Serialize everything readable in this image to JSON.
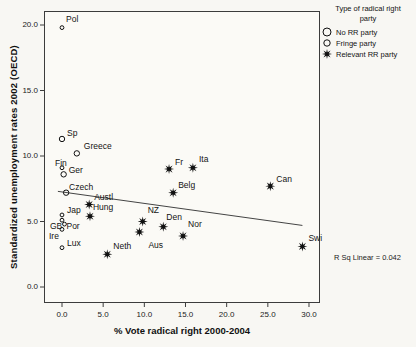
{
  "figure": {
    "colors": {
      "background": "#f8f7f3",
      "frame": "#3c3c3c",
      "marker": "#101010",
      "fit_line": "#444444",
      "text": "#131313"
    }
  },
  "legend": {
    "title_line1": "Type of radical right",
    "title_line2": "party",
    "items": [
      {
        "label": "No RR party",
        "marker": "circle-large"
      },
      {
        "label": "Fringe party",
        "marker": "circle-small"
      },
      {
        "label": "Relevant RR party",
        "marker": "star"
      }
    ]
  },
  "annotation": {
    "r_sq": "R Sq Linear = 0.042"
  },
  "chart_data": {
    "type": "scatter",
    "title": "",
    "xlabel": "% Vote radical right 2000-2004",
    "ylabel": "Standardized unemployment rates 2002 (OECD)",
    "xlim": [
      -2.2,
      31.3
    ],
    "ylim": [
      -1.2,
      21.1
    ],
    "grid": false,
    "legend_position": "top-right-outside",
    "xticks": {
      "values": [
        0,
        5,
        10,
        15,
        20,
        25,
        30
      ],
      "labels": [
        "0.0",
        "5.0",
        "10.0",
        "15.0",
        "20.0",
        "25.0",
        "30.0"
      ]
    },
    "yticks": {
      "values": [
        0,
        5,
        10,
        15,
        20
      ],
      "labels": [
        "0.0",
        "5.0",
        "10.0",
        "15.0",
        "20.0"
      ]
    },
    "series": [
      {
        "name": "No RR party",
        "marker": "circle-large",
        "points": [
          {
            "label": "Sp",
            "x": 0.0,
            "y": 11.3,
            "label_dx": 5,
            "label_dy": -11
          },
          {
            "label": "Greece",
            "x": 1.8,
            "y": 10.2,
            "label_dx": 7,
            "label_dy": -12
          },
          {
            "label": "Ger",
            "x": 0.2,
            "y": 8.6,
            "label_dx": 5,
            "label_dy": -9
          },
          {
            "label": "Czech",
            "x": 0.5,
            "y": 7.2,
            "label_dx": 3,
            "label_dy": -11
          }
        ]
      },
      {
        "name": "Fringe party",
        "marker": "circle-small",
        "points": [
          {
            "label": "Pol",
            "x": 0.0,
            "y": 19.8,
            "label_dx": 4,
            "label_dy": -14
          },
          {
            "label": "Fin",
            "x": 0.0,
            "y": 9.1,
            "label_dx": -7,
            "label_dy": -10
          },
          {
            "label": "Jap",
            "x": 0.0,
            "y": 5.5,
            "label_dx": 5,
            "label_dy": -10
          },
          {
            "label": "GB",
            "x": 0.0,
            "y": 5.1,
            "label_dx": -12,
            "label_dy": 1
          },
          {
            "label": "Por",
            "x": 0.3,
            "y": 4.8,
            "label_dx": 2,
            "label_dy": -3
          },
          {
            "label": "Ire",
            "x": 0.0,
            "y": 4.4,
            "label_dx": -13,
            "label_dy": 2
          },
          {
            "label": "Lux",
            "x": 0.0,
            "y": 3.0,
            "label_dx": 5,
            "label_dy": -10
          }
        ]
      },
      {
        "name": "Relevant RR party",
        "marker": "star",
        "points": [
          {
            "label": "Austl",
            "x": 3.3,
            "y": 6.3,
            "label_dx": 5,
            "label_dy": -12
          },
          {
            "label": "Hung",
            "x": 3.4,
            "y": 5.4,
            "label_dx": 3,
            "label_dy": -14
          },
          {
            "label": "Neth",
            "x": 5.5,
            "y": 2.5,
            "label_dx": 6,
            "label_dy": -13
          },
          {
            "label": "NZ",
            "x": 9.8,
            "y": 5.0,
            "label_dx": 5,
            "label_dy": -17
          },
          {
            "label": "Aus",
            "x": 9.4,
            "y": 4.2,
            "label_dx": 9,
            "label_dy": 8
          },
          {
            "label": "Den",
            "x": 12.3,
            "y": 4.6,
            "label_dx": 3,
            "label_dy": -15
          },
          {
            "label": "Nor",
            "x": 14.7,
            "y": 3.9,
            "label_dx": 5,
            "label_dy": -17
          },
          {
            "label": "Fr",
            "x": 13.0,
            "y": 9.0,
            "label_dx": 6,
            "label_dy": -12
          },
          {
            "label": "Ita",
            "x": 15.9,
            "y": 9.1,
            "label_dx": 6,
            "label_dy": -14
          },
          {
            "label": "Belg",
            "x": 13.5,
            "y": 7.2,
            "label_dx": 5,
            "label_dy": -13
          },
          {
            "label": "Can",
            "x": 25.3,
            "y": 7.7,
            "label_dx": 6,
            "label_dy": -12
          },
          {
            "label": "Swi",
            "x": 29.2,
            "y": 3.1,
            "label_dx": 6,
            "label_dy": -13
          }
        ]
      }
    ],
    "fit_line": {
      "x1": -0.5,
      "y1": 7.3,
      "x2": 29.2,
      "y2": 4.7,
      "r_squared": 0.042
    }
  }
}
